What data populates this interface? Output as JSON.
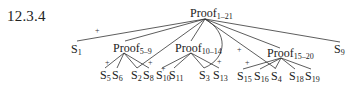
{
  "section_number": "12.3.4",
  "tree": {
    "root": {
      "label": "Proof",
      "sub": "1–21"
    },
    "level1": [
      {
        "id": "S1",
        "label": "S",
        "sub": "1"
      },
      {
        "id": "P5_9",
        "label": "Proof",
        "sub": "5–9"
      },
      {
        "id": "P10_14",
        "label": "Proof",
        "sub": "10–14"
      },
      {
        "id": "P15_20",
        "label": "Proof",
        "sub": "15–20"
      },
      {
        "id": "S9",
        "label": "S",
        "sub": "9"
      }
    ],
    "leaves": [
      {
        "id": "S5",
        "label": "S",
        "sub": "5"
      },
      {
        "id": "S6",
        "label": "S",
        "sub": "6"
      },
      {
        "id": "S2",
        "label": "S",
        "sub": "2"
      },
      {
        "id": "S8",
        "label": "S",
        "sub": "8"
      },
      {
        "id": "S10",
        "label": "S",
        "sub": "10"
      },
      {
        "id": "S11",
        "label": "S",
        "sub": "11"
      },
      {
        "id": "S3",
        "label": "S",
        "sub": "3"
      },
      {
        "id": "S13",
        "label": "S",
        "sub": "13"
      },
      {
        "id": "S15",
        "label": "S",
        "sub": "15"
      },
      {
        "id": "S16",
        "label": "S",
        "sub": "16"
      },
      {
        "id": "S4",
        "label": "S",
        "sub": "4"
      },
      {
        "id": "S18",
        "label": "S",
        "sub": "18"
      },
      {
        "id": "S19",
        "label": "S",
        "sub": "19"
      }
    ],
    "plus_sign": "+"
  },
  "colors": {
    "line": "#333333",
    "text": "#222222",
    "background": "#ffffff"
  }
}
